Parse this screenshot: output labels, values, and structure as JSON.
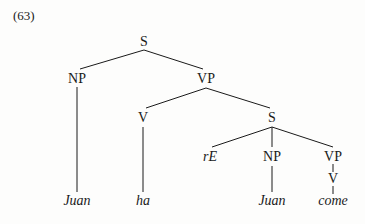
{
  "example_number": "(63)",
  "tree": {
    "nodes": [
      {
        "id": "s_root",
        "label": "S",
        "x": 144,
        "y": 42,
        "italic": false
      },
      {
        "id": "np1",
        "label": "NP",
        "x": 77,
        "y": 79,
        "italic": false
      },
      {
        "id": "vp1",
        "label": "VP",
        "x": 206,
        "y": 79,
        "italic": false
      },
      {
        "id": "v1",
        "label": "V",
        "x": 143,
        "y": 118,
        "italic": false
      },
      {
        "id": "s2",
        "label": "S",
        "x": 272,
        "y": 118,
        "italic": false
      },
      {
        "id": "re",
        "label": "rE",
        "x": 210,
        "y": 157,
        "italic": true
      },
      {
        "id": "np2",
        "label": "NP",
        "x": 272,
        "y": 157,
        "italic": false
      },
      {
        "id": "vp2",
        "label": "VP",
        "x": 333,
        "y": 157,
        "italic": false
      },
      {
        "id": "v2",
        "label": "V",
        "x": 333,
        "y": 179,
        "italic": false
      },
      {
        "id": "juan1",
        "label": "Juan",
        "x": 77,
        "y": 201,
        "italic": true
      },
      {
        "id": "ha",
        "label": "ha",
        "x": 143,
        "y": 201,
        "italic": true
      },
      {
        "id": "juan2",
        "label": "Juan",
        "x": 272,
        "y": 201,
        "italic": true
      },
      {
        "id": "come",
        "label": "come",
        "x": 333,
        "y": 201,
        "italic": true
      }
    ],
    "edges": [
      {
        "from": "s_root",
        "to": "np1",
        "x1": 144,
        "y1": 50,
        "x2": 80,
        "y2": 69
      },
      {
        "from": "s_root",
        "to": "vp1",
        "x1": 144,
        "y1": 50,
        "x2": 203,
        "y2": 69
      },
      {
        "from": "np1",
        "to": "juan1",
        "x1": 77,
        "y1": 87,
        "x2": 77,
        "y2": 192
      },
      {
        "from": "vp1",
        "to": "v1",
        "x1": 206,
        "y1": 88,
        "x2": 146,
        "y2": 108
      },
      {
        "from": "vp1",
        "to": "s2",
        "x1": 206,
        "y1": 88,
        "x2": 270,
        "y2": 108
      },
      {
        "from": "v1",
        "to": "ha",
        "x1": 143,
        "y1": 127,
        "x2": 143,
        "y2": 192
      },
      {
        "from": "s2",
        "to": "re",
        "x1": 272,
        "y1": 127,
        "x2": 212,
        "y2": 147
      },
      {
        "from": "s2",
        "to": "np2",
        "x1": 272,
        "y1": 127,
        "x2": 272,
        "y2": 147
      },
      {
        "from": "s2",
        "to": "vp2",
        "x1": 272,
        "y1": 127,
        "x2": 333,
        "y2": 147
      },
      {
        "from": "np2",
        "to": "juan2",
        "x1": 272,
        "y1": 166,
        "x2": 272,
        "y2": 192
      },
      {
        "from": "vp2",
        "to": "v2",
        "x1": 333,
        "y1": 164,
        "x2": 333,
        "y2": 172
      },
      {
        "from": "v2",
        "to": "come",
        "x1": 333,
        "y1": 186,
        "x2": 333,
        "y2": 194
      }
    ]
  },
  "colors": {
    "ink": "#1a1a1a",
    "background": "#fdfdfc"
  }
}
